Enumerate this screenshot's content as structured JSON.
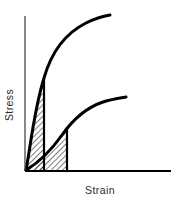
{
  "figure": {
    "name": "stress-strain-toughness-diagram",
    "background_color": "#ffffff",
    "ink_color": "#000000",
    "label_color": "#2b2b2b"
  },
  "axes": {
    "y_label": "Stress",
    "x_label": "Strain",
    "x_axis_color": "#000000",
    "y_axis_color": "#3a3a3a",
    "x_axis_width_px": 2.2,
    "y_axis_width_px": 1.2,
    "origin": {
      "x": 25,
      "y": 171
    },
    "x_axis_end": {
      "x": 171,
      "y": 171
    },
    "y_axis_top": {
      "x": 25,
      "y": 16
    },
    "ticks_shown": false,
    "gridlines_shown": false,
    "tick_labels": []
  },
  "curves": [
    {
      "name": "high-strength-brittle-curve",
      "label": "Upper curve (high stress, low strain)",
      "stroke_color": "#000000",
      "stroke_width_px": 3.0,
      "path": "M 26 170 C 30 150 34 110 44 78 C 52 50 68 32 86 23 C 96 18 104 16 110 15",
      "end_point": {
        "x": 110,
        "y": 15
      }
    },
    {
      "name": "ductile-low-strength-curve",
      "label": "Lower curve (low stress, higher strain)",
      "stroke_color": "#000000",
      "stroke_width_px": 3.0,
      "path": "M 26 170 C 38 163 50 152 62 135 C 74 118 88 107 103 102 C 112 99 120 98 126 97",
      "end_point": {
        "x": 126,
        "y": 97
      }
    }
  ],
  "shaded_regions": [
    {
      "name": "upper-curve-hatched-area",
      "label": "Area under upper curve up to its drop line",
      "fill": "hatch-45",
      "hatch_color": "#000000",
      "hatch_spacing_px": 4,
      "hatch_width_px": 1,
      "outline_color": "#000000",
      "outline_width_px": 2.2,
      "drop_line_x": 44,
      "drop_line_top_y": 78,
      "path": "M 26 170 C 30 150 34 110 44 78 L 44 170 Z"
    },
    {
      "name": "lower-curve-hatched-area",
      "label": "Area under lower curve up to its drop line",
      "fill": "hatch-45",
      "hatch_color": "#000000",
      "hatch_spacing_px": 4,
      "hatch_width_px": 1,
      "outline_color": "#000000",
      "outline_width_px": 2.2,
      "drop_line_x": 67,
      "drop_line_top_y": 129,
      "path": "M 26 170 C 38 163 50 152 62 135 C 64 132 65 131 67 129 L 67 170 Z"
    }
  ],
  "chart_data": {
    "type": "line",
    "title": "",
    "subtitle": "",
    "xlabel": "Strain",
    "ylabel": "Stress",
    "xlim": [
      0,
      1
    ],
    "ylim": [
      0,
      1
    ],
    "grid": false,
    "legend": null,
    "axis_tick_labels": {
      "x": [],
      "y": []
    },
    "annotations": [
      "Hatched area under each curve represents toughness (energy absorbed to failure)"
    ],
    "series": [
      {
        "name": "Upper curve — high strength, low ductility",
        "x": [
          0.0,
          0.02,
          0.04,
          0.06,
          0.08,
          0.1,
          0.13,
          0.17,
          0.22,
          0.3,
          0.38,
          0.46,
          0.54,
          0.58
        ],
        "y": [
          0.0,
          0.13,
          0.26,
          0.38,
          0.48,
          0.57,
          0.66,
          0.74,
          0.81,
          0.88,
          0.93,
          0.96,
          0.99,
          1.0
        ],
        "shaded_to_x": 0.13,
        "shaded": true
      },
      {
        "name": "Lower curve — lower strength, higher ductility",
        "x": [
          0.0,
          0.04,
          0.09,
          0.14,
          0.2,
          0.25,
          0.29,
          0.36,
          0.45,
          0.54,
          0.63,
          0.69
        ],
        "y": [
          0.0,
          0.06,
          0.13,
          0.2,
          0.27,
          0.31,
          0.34,
          0.39,
          0.43,
          0.45,
          0.47,
          0.48
        ],
        "shaded_to_x": 0.29,
        "shaded": true
      }
    ]
  }
}
